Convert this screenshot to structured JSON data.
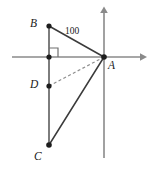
{
  "figure": {
    "type": "geometry-diagram",
    "width": 148,
    "height": 174,
    "background_color": "#ffffff",
    "stroke_color": "#3b3b3b",
    "axis_color": "#8a8a8a",
    "dashed_color": "#8f8f8f",
    "points": [
      {
        "id": "B",
        "label": "B",
        "x": 49,
        "y": 26,
        "label_x": 30,
        "label_y": 18
      },
      {
        "id": "A",
        "label": "A",
        "x": 104,
        "y": 57,
        "label_x": 108,
        "label_y": 60
      },
      {
        "id": "D",
        "label": "D",
        "x": 49,
        "y": 86,
        "label_x": 30,
        "label_y": 79
      },
      {
        "id": "C",
        "label": "C",
        "x": 49,
        "y": 145,
        "label_x": 34,
        "label_y": 152
      }
    ],
    "segments": [
      {
        "id": "BA",
        "from": "B",
        "to": "A",
        "style": "solid"
      },
      {
        "id": "CA",
        "from": "C",
        "to": "A",
        "style": "solid"
      },
      {
        "id": "DA",
        "from": "D",
        "to": "A",
        "style": "dashed"
      },
      {
        "id": "BC",
        "from": "B",
        "to": "C",
        "style": "solid-vertical"
      }
    ],
    "measure_labels": [
      {
        "id": "BA-length",
        "text": "100",
        "x": 65,
        "y": 31
      }
    ],
    "right_angle": {
      "at_x": 49,
      "at_y": 57,
      "size": 9,
      "description": "right angle between segment BC and the horizontal axis"
    },
    "axes": {
      "x_axis": {
        "y": 57,
        "x_start": 12,
        "x_end": 145,
        "arrow": "right"
      },
      "y_axis": {
        "x": 104,
        "y_start": 8,
        "y_end": 158,
        "arrow": "up"
      }
    }
  }
}
